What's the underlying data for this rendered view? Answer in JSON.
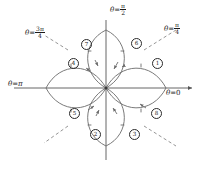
{
  "figure": {
    "background_color": "#ffffff",
    "curve_color": "#6b6b6b",
    "axis_color": "#555555",
    "dashed_color": "#777777",
    "label_color": "#1a1a1a"
  },
  "axes": {
    "origin": {
      "x": 106,
      "y": 88
    },
    "horizontal": {
      "x1": 14,
      "y1": 88,
      "x2": 196,
      "y2": 88,
      "arrow": "right"
    },
    "vertical": {
      "x1": 106,
      "y1": 20,
      "x2": 106,
      "y2": 160
    },
    "labels": {
      "right": {
        "theta": "θ",
        "equals": "=",
        "value": "0",
        "x": 168,
        "y": 93
      },
      "left": {
        "theta": "θ",
        "equals": "=",
        "value": "π",
        "x": 10,
        "y": 83
      },
      "top": {
        "theta": "θ",
        "equals": "=",
        "num": "π",
        "den": "2",
        "x": 110,
        "y": 4
      },
      "upper_right": {
        "theta": "θ",
        "equals": "=",
        "num": "π",
        "den": "4",
        "x": 166,
        "y": 24
      },
      "upper_left": {
        "theta": "θ",
        "equals": "=",
        "num": "3π",
        "den": "4",
        "x": 27,
        "y": 28
      }
    }
  },
  "dashed_rays": [
    {
      "name": "ray-pi-over-4",
      "angle_deg": 45,
      "x1": 146,
      "y1": 48,
      "x2": 172,
      "y2": 33
    },
    {
      "name": "ray-3pi-over-4",
      "angle_deg": 135,
      "x1": 66,
      "y1": 48,
      "x2": 47,
      "y2": 37
    },
    {
      "name": "ray-5pi-over-4",
      "angle_deg": 225,
      "x1": 66,
      "y1": 128,
      "x2": 47,
      "y2": 142
    },
    {
      "name": "ray-7pi-over-4",
      "angle_deg": 315,
      "x1": 146,
      "y1": 128,
      "x2": 172,
      "y2": 144
    }
  ],
  "petals": [
    {
      "id": 1,
      "label": "①",
      "text": "1",
      "direction_deg": 0,
      "half": "upper",
      "marker_x": 152,
      "marker_y": 58
    },
    {
      "id": 2,
      "label": "②",
      "text": "2",
      "direction_deg": 270,
      "half": "left",
      "marker_x": 90,
      "marker_y": 129
    },
    {
      "id": 3,
      "label": "③",
      "text": "3",
      "direction_deg": 270,
      "half": "right",
      "marker_x": 129,
      "marker_y": 129
    },
    {
      "id": 4,
      "label": "④",
      "text": "4",
      "direction_deg": 180,
      "half": "upper",
      "marker_x": 68,
      "marker_y": 58
    },
    {
      "id": 5,
      "label": "⑤",
      "text": "5",
      "direction_deg": 180,
      "half": "lower",
      "marker_x": 69,
      "marker_y": 108
    },
    {
      "id": 6,
      "label": "⑥",
      "text": "6",
      "direction_deg": 90,
      "half": "right",
      "marker_x": 131,
      "marker_y": 38
    },
    {
      "id": 7,
      "label": "⑦",
      "text": "7",
      "direction_deg": 90,
      "half": "left",
      "marker_x": 81,
      "marker_y": 39
    },
    {
      "id": 8,
      "label": "⑧",
      "text": "8",
      "direction_deg": 0,
      "half": "lower",
      "marker_x": 151,
      "marker_y": 108
    }
  ],
  "curve": {
    "type": "rose",
    "equation": "r = cos(2θ)",
    "petal_count": 4,
    "traversal_segments": 8,
    "petal_length_px": 60,
    "petal_half_width_px": 27,
    "tick_marks_per_petal": 2
  }
}
